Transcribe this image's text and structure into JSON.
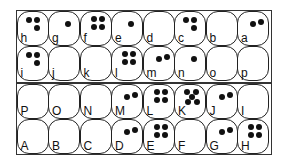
{
  "board": {
    "title": "Pit board",
    "colors": {
      "frame": "#333333",
      "dot": "#111111",
      "cell_bg": "#ffffff"
    },
    "top_half": {
      "rows": [
        [
          {
            "label": "h",
            "dots": 3
          },
          {
            "label": "g",
            "dots": 1
          },
          {
            "label": "f",
            "dots": 4
          },
          {
            "label": "e",
            "dots": 1
          },
          {
            "label": "d",
            "dots": 0
          },
          {
            "label": "c",
            "dots": 3
          },
          {
            "label": "b",
            "dots": 0
          },
          {
            "label": "a",
            "dots": 2
          }
        ],
        [
          {
            "label": "i",
            "dots": 3
          },
          {
            "label": "j",
            "dots": 0
          },
          {
            "label": "k",
            "dots": 0
          },
          {
            "label": "l",
            "dots": 4
          },
          {
            "label": "m",
            "dots": 2
          },
          {
            "label": "n",
            "dots": 1
          },
          {
            "label": "o",
            "dots": 0
          },
          {
            "label": "p",
            "dots": 0
          }
        ]
      ]
    },
    "bottom_half": {
      "rows": [
        [
          {
            "label": "P",
            "dots": 0
          },
          {
            "label": "O",
            "dots": 0
          },
          {
            "label": "N",
            "dots": 0
          },
          {
            "label": "M",
            "dots": 2
          },
          {
            "label": "L",
            "dots": 4
          },
          {
            "label": "K",
            "dots": 5
          },
          {
            "label": "J",
            "dots": 2
          },
          {
            "label": "I",
            "dots": 0
          }
        ],
        [
          {
            "label": "A",
            "dots": 0
          },
          {
            "label": "B",
            "dots": 0
          },
          {
            "label": "C",
            "dots": 0
          },
          {
            "label": "D",
            "dots": 2
          },
          {
            "label": "E",
            "dots": 4
          },
          {
            "label": "F",
            "dots": 0
          },
          {
            "label": "G",
            "dots": 2
          },
          {
            "label": "H",
            "dots": 4
          }
        ]
      ]
    }
  }
}
